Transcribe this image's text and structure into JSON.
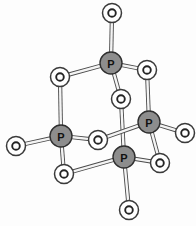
{
  "figure": {
    "formula": "P4O10",
    "style": "ball-and-stick",
    "background_color": "#fdfdfd",
    "canvas": {
      "width": 196,
      "height": 226
    }
  },
  "legend": {
    "phosphorus_label": "P",
    "oxygen_label": "O",
    "phosphorus_color": "#8d8d8d",
    "oxygen_color": "#ffffff",
    "bond_color": "#4a4a4a"
  },
  "atoms": [
    {
      "id": "P1",
      "element": "P",
      "label": "P",
      "role": "phosphorus-top",
      "x": 111,
      "y": 63,
      "r": 11
    },
    {
      "id": "P2",
      "element": "P",
      "label": "P",
      "role": "phosphorus-left",
      "x": 61,
      "y": 136,
      "r": 11
    },
    {
      "id": "P3",
      "element": "P",
      "label": "P",
      "role": "phosphorus-right",
      "x": 149,
      "y": 122,
      "r": 11
    },
    {
      "id": "P4",
      "element": "P",
      "label": "P",
      "role": "phosphorus-bottom",
      "x": 124,
      "y": 157,
      "r": 11
    },
    {
      "id": "O1",
      "element": "O",
      "label": "O",
      "role": "oxygen-terminal-top",
      "x": 112,
      "y": 13,
      "r": 9.5
    },
    {
      "id": "O2",
      "element": "O",
      "label": "O",
      "role": "oxygen-bridge-upper-left",
      "x": 60,
      "y": 77,
      "r": 9.5
    },
    {
      "id": "O3",
      "element": "O",
      "label": "O",
      "role": "oxygen-bridge-upper-right",
      "x": 147,
      "y": 70,
      "r": 9.5
    },
    {
      "id": "O4",
      "element": "O",
      "label": "O",
      "role": "oxygen-bridge-center",
      "x": 121,
      "y": 99,
      "r": 9.5
    },
    {
      "id": "O5",
      "element": "O",
      "label": "O",
      "role": "oxygen-terminal-far-right",
      "x": 185,
      "y": 133,
      "r": 9.5
    },
    {
      "id": "O6",
      "element": "O",
      "label": "O",
      "role": "oxygen-terminal-far-left",
      "x": 16,
      "y": 146,
      "r": 9.5
    },
    {
      "id": "O7",
      "element": "O",
      "label": "O",
      "role": "oxygen-bridge-middle",
      "x": 98,
      "y": 140,
      "r": 9.5
    },
    {
      "id": "O8",
      "element": "O",
      "label": "O",
      "role": "oxygen-bridge-lower-right",
      "x": 160,
      "y": 163,
      "r": 9.5
    },
    {
      "id": "O9",
      "element": "O",
      "label": "O",
      "role": "oxygen-bridge-lower-left",
      "x": 64,
      "y": 174,
      "r": 9.5
    },
    {
      "id": "O10",
      "element": "O",
      "label": "O",
      "role": "oxygen-terminal-bottom",
      "x": 129,
      "y": 210,
      "r": 9.5
    }
  ],
  "bonds": [
    {
      "id": "b1",
      "from": "P1",
      "to": "O1",
      "kind": "terminal"
    },
    {
      "id": "b2",
      "from": "P1",
      "to": "O2",
      "kind": "bridge"
    },
    {
      "id": "b3",
      "from": "P1",
      "to": "O3",
      "kind": "bridge"
    },
    {
      "id": "b4",
      "from": "P1",
      "to": "O4",
      "kind": "bridge"
    },
    {
      "id": "b5",
      "from": "O2",
      "to": "P2",
      "kind": "bridge"
    },
    {
      "id": "b6",
      "from": "O3",
      "to": "P3",
      "kind": "bridge"
    },
    {
      "id": "b7",
      "from": "O4",
      "to": "P4",
      "kind": "bridge"
    },
    {
      "id": "b8",
      "from": "P2",
      "to": "O6",
      "kind": "terminal"
    },
    {
      "id": "b9",
      "from": "P2",
      "to": "O7",
      "kind": "bridge"
    },
    {
      "id": "b10",
      "from": "O7",
      "to": "P3",
      "kind": "bridge"
    },
    {
      "id": "b11",
      "from": "P2",
      "to": "O9",
      "kind": "bridge"
    },
    {
      "id": "b12",
      "from": "O9",
      "to": "P4",
      "kind": "bridge"
    },
    {
      "id": "b13",
      "from": "P3",
      "to": "O5",
      "kind": "terminal"
    },
    {
      "id": "b14",
      "from": "P3",
      "to": "O8",
      "kind": "bridge"
    },
    {
      "id": "b15",
      "from": "O8",
      "to": "P4",
      "kind": "bridge"
    },
    {
      "id": "b16",
      "from": "P4",
      "to": "O10",
      "kind": "terminal"
    }
  ]
}
